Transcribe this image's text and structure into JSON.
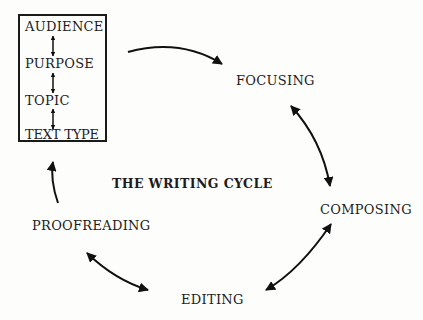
{
  "diagram": {
    "title": "THE WRITING CYCLE",
    "context_box": {
      "items": [
        "AUDIENCE",
        "PURPOSE",
        "TOPIC",
        "TEXT TYPE"
      ]
    },
    "stages": {
      "focusing": "FOCUSING",
      "composing": "COMPOSING",
      "editing": "EDITING",
      "proofreading": "PROOFREADING"
    },
    "connections": [
      {
        "from": "context_box",
        "to": "focusing",
        "direction": "one-way"
      },
      {
        "from": "focusing",
        "to": "composing",
        "direction": "two-way"
      },
      {
        "from": "composing",
        "to": "editing",
        "direction": "two-way"
      },
      {
        "from": "editing",
        "to": "proofreading",
        "direction": "two-way"
      },
      {
        "from": "proofreading",
        "to": "context_box",
        "direction": "one-way"
      }
    ],
    "box_links": [
      {
        "from": "AUDIENCE",
        "to": "PURPOSE",
        "direction": "two-way"
      },
      {
        "from": "PURPOSE",
        "to": "TOPIC",
        "direction": "two-way"
      },
      {
        "from": "TOPIC",
        "to": "TEXT TYPE",
        "direction": "two-way"
      }
    ]
  }
}
